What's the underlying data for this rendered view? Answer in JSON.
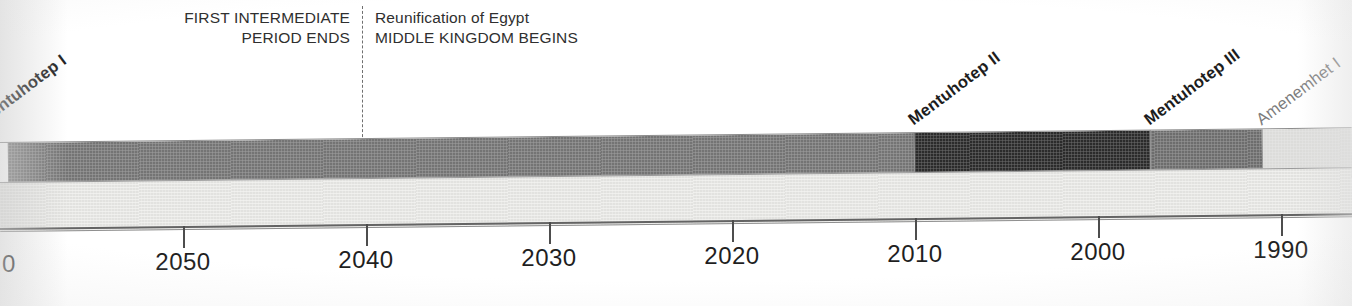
{
  "figure": {
    "type": "timeline",
    "title": ""
  },
  "annotations": {
    "left_block": {
      "line1": "FIRST INTERMEDIATE",
      "line2": "PERIOD ENDS"
    },
    "right_block": {
      "line1": "Reunification of Egypt",
      "line2": "MIDDLE KINGDOM BEGINS"
    },
    "divider_x": 362,
    "divider_year": 2040
  },
  "chart_data": {
    "type": "bar",
    "orientation": "horizontal-timeline",
    "title": "",
    "xlabel": "",
    "ylabel": "",
    "axis": {
      "direction": "decreasing",
      "tick_labels": [
        "0",
        "2050",
        "2040",
        "2030",
        "2020",
        "2010",
        "2000",
        "1990"
      ],
      "tick_x": [
        14,
        183,
        366,
        549,
        732,
        915,
        1098,
        1281
      ],
      "tick_values": [
        2060,
        2050,
        2040,
        2030,
        2020,
        2010,
        2000,
        1990
      ],
      "grid": false,
      "legend": "none"
    },
    "segments": [
      {
        "label": "Mentuhotep I",
        "label_style": "bold",
        "x_start": 8,
        "x_end": 914,
        "color": "#757575",
        "year_start": 2060,
        "year_end": 2010
      },
      {
        "label": "Mentuhotep II",
        "label_style": "bold",
        "x_start": 914,
        "x_end": 1150,
        "color": "#2b2b2b",
        "year_start": 2010,
        "year_end": 1997
      },
      {
        "label": "Mentuhotep III",
        "label_style": "bold",
        "x_start": 1150,
        "x_end": 1262,
        "color": "#6e6e6e",
        "year_start": 1997,
        "year_end": 1991
      },
      {
        "label": "Amenemhet I",
        "label_style": "light",
        "x_start": 1262,
        "x_end": 1352,
        "color": "#dcdcda",
        "year_start": 1991,
        "year_end": 1986
      }
    ],
    "lower_band": {
      "color": "#ebebe9",
      "label": ""
    }
  },
  "colors": {
    "segment_dark": "#2b2b2b",
    "segment_medium": "#757575",
    "segment_medium_light": "#6e6e6e",
    "segment_light": "#dcdcda",
    "lower_band": "#ebebe9",
    "text_primary": "#1f1f1f",
    "text_muted": "#7c7c7c",
    "rule": "#646464"
  },
  "rotated_labels": [
    {
      "text": "Mentuhotep I",
      "style": "bold",
      "left": -14,
      "bottom_top": 128
    },
    {
      "text": "Mentuhotep II",
      "style": "bold",
      "left": 916,
      "bottom_top": 128
    },
    {
      "text": "Mentuhotep III",
      "style": "bold",
      "left": 1152,
      "bottom_top": 128
    },
    {
      "text": "Amenemhet I",
      "style": "light",
      "left": 1264,
      "bottom_top": 128
    }
  ]
}
